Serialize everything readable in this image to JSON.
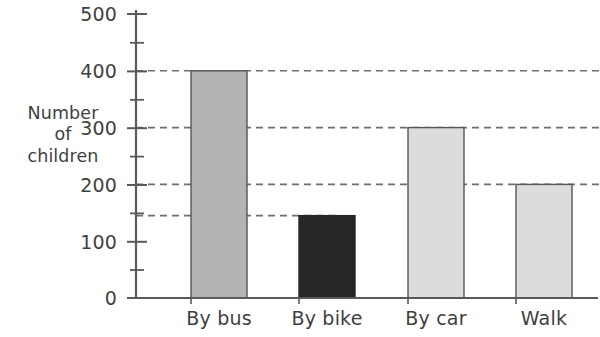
{
  "chart_data": {
    "type": "bar",
    "title": "",
    "xlabel": "",
    "ylabel": "Number of children",
    "ylabel_lines": [
      "Number",
      "of",
      "children"
    ],
    "categories": [
      "By bus",
      "By bike",
      "By car",
      "Walk"
    ],
    "values": [
      400,
      145,
      300,
      200
    ],
    "series": [
      {
        "name": "Number of children",
        "values": [
          400,
          145,
          300,
          200
        ]
      }
    ],
    "bar_colors": [
      "#b3b3b3",
      "#262626",
      "#dcdcdc",
      "#dcdcdc"
    ],
    "bar_border_color": "#555555",
    "ylim": [
      0,
      500
    ],
    "y_major_ticks": [
      0,
      100,
      200,
      300,
      400,
      500
    ],
    "y_minor_ticks": [
      50,
      150,
      250,
      350,
      450
    ],
    "y_tick_labels": [
      "0",
      "100",
      "200",
      "300",
      "400",
      "500"
    ],
    "gridlines": [
      400,
      300,
      200,
      145
    ],
    "grid": "dashed-horizontal-partial",
    "legend": "none",
    "axis_color": "#5a5a5a",
    "grid_color": "#6e6e6e"
  }
}
